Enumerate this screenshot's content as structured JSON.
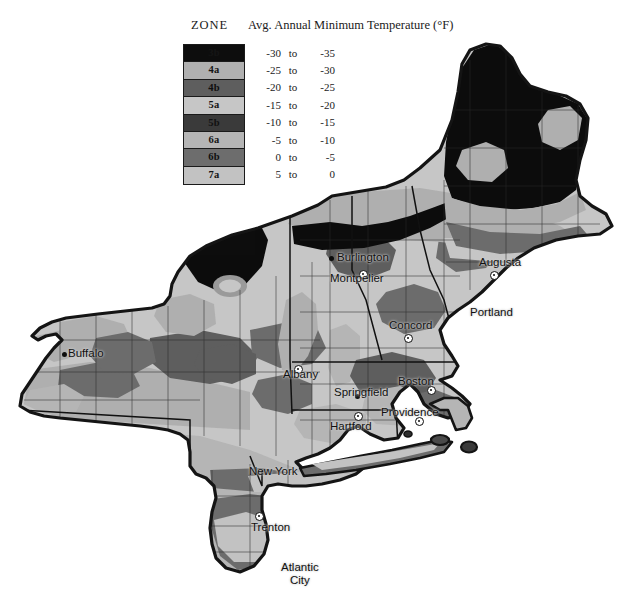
{
  "legend": {
    "zone_header": "ZONE",
    "temp_header": "Avg. Annual Minimum Temperature (°F)",
    "rows": [
      {
        "zone": "3b",
        "low": "-30",
        "to": "to",
        "high": "-35",
        "color": "#0d0d0d",
        "label_color": "#151515"
      },
      {
        "zone": "4a",
        "low": "-25",
        "to": "to",
        "high": "-30",
        "color": "#b0b0b0",
        "label_color": "#141414"
      },
      {
        "zone": "4b",
        "low": "-20",
        "to": "to",
        "high": "-25",
        "color": "#5e5e5e",
        "label_color": "#0f0f0f"
      },
      {
        "zone": "5a",
        "low": "-15",
        "to": "to",
        "high": "-20",
        "color": "#c6c6c6",
        "label_color": "#141414"
      },
      {
        "zone": "5b",
        "low": "-10",
        "to": "to",
        "high": "-15",
        "color": "#3a3a3a",
        "label_color": "#111111"
      },
      {
        "zone": "6a",
        "low": "-5",
        "to": "to",
        "high": "-10",
        "color": "#b5b5b5",
        "label_color": "#141414"
      },
      {
        "zone": "6b",
        "low": "0",
        "to": "to",
        "high": "-5",
        "color": "#6d6d6d",
        "label_color": "#101010"
      },
      {
        "zone": "7a",
        "low": "5",
        "to": "to",
        "high": "0",
        "color": "#c2c2c2",
        "label_color": "#141414"
      }
    ]
  },
  "map": {
    "title_alt": "USDA Plant Hardiness Zones — Northeastern United States",
    "outline_color": "#141414",
    "county_line_color": "#2b2b2b",
    "cities": [
      {
        "name": "Buffalo",
        "label_x": 68,
        "label_y": 347,
        "marker": "dot",
        "marker_x": 62,
        "marker_y": 352
      },
      {
        "name": "Burlington",
        "label_x": 337,
        "label_y": 251,
        "marker": "dot",
        "marker_x": 329,
        "marker_y": 256
      },
      {
        "name": "Montpelier",
        "label_x": 330,
        "label_y": 272,
        "marker": "capital",
        "marker_x": 359,
        "marker_y": 270
      },
      {
        "name": "Augusta",
        "label_x": 479,
        "label_y": 256,
        "marker": "capital",
        "marker_x": 490,
        "marker_y": 271
      },
      {
        "name": "Portland",
        "label_x": 470,
        "label_y": 306,
        "marker": "none",
        "marker_x": 0,
        "marker_y": 0
      },
      {
        "name": "Concord",
        "label_x": 389,
        "label_y": 319,
        "marker": "capital",
        "marker_x": 404,
        "marker_y": 334
      },
      {
        "name": "Albany",
        "label_x": 283,
        "label_y": 368,
        "marker": "capital",
        "marker_x": 294,
        "marker_y": 365
      },
      {
        "name": "Springfield",
        "label_x": 334,
        "label_y": 386,
        "marker": "dot",
        "marker_x": 355,
        "marker_y": 394
      },
      {
        "name": "Boston",
        "label_x": 398,
        "label_y": 375,
        "marker": "capital",
        "marker_x": 427,
        "marker_y": 386
      },
      {
        "name": "Providence",
        "label_x": 381,
        "label_y": 406,
        "marker": "capital",
        "marker_x": 415,
        "marker_y": 417
      },
      {
        "name": "Hartford",
        "label_x": 330,
        "label_y": 420,
        "marker": "capital",
        "marker_x": 354,
        "marker_y": 412
      },
      {
        "name": "New York",
        "label_x": 249,
        "label_y": 465,
        "marker": "none",
        "marker_x": 0,
        "marker_y": 0
      },
      {
        "name": "Trenton",
        "label_x": 251,
        "label_y": 521,
        "marker": "capital",
        "marker_x": 255,
        "marker_y": 512
      },
      {
        "name": "Atlantic",
        "name2": "City",
        "label_x": 281,
        "label_y": 561,
        "marker": "none",
        "marker_x": 0,
        "marker_y": 0
      }
    ]
  }
}
